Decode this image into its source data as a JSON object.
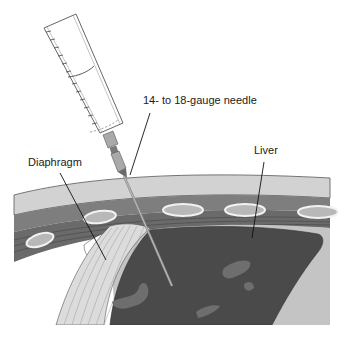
{
  "figure": {
    "labels": {
      "needle": "14- to 18-gauge needle",
      "diaphragm": "Diaphragm",
      "liver": "Liver"
    },
    "colors": {
      "background": "#ffffff",
      "skin": "#d2d2d2",
      "muscle": "#7e7e7e",
      "rib_outline": "#f2f2f2",
      "rib_core": "#b8b8b8",
      "intercostal": "#6a6a6a",
      "pleura": "#c4c4c4",
      "diaphragm_fibers": "#e6e6e6",
      "liver": "#4a4a4a",
      "liver_vessels": "#6e6e6e",
      "syringe_outline": "#555555",
      "hub": "#a9a9a9",
      "needle": "#8a8a8a",
      "leader_line": "#111111"
    }
  }
}
